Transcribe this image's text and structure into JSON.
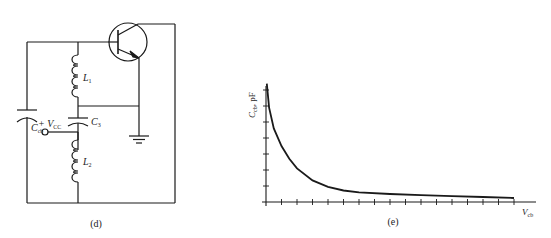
{
  "figure": {
    "panel_d": {
      "caption": "(d)",
      "components": {
        "transistor": "bjt-npn",
        "capacitor_cb": {
          "symbol": "C",
          "subscript": "cb"
        },
        "inductor_1": {
          "symbol": "L",
          "subscript": "1"
        },
        "capacitor_3": {
          "symbol": "C",
          "subscript": "3"
        },
        "inductor_2": {
          "symbol": "L",
          "subscript": "2"
        },
        "supply": {
          "prefix": "+ V",
          "subscript": "CC"
        },
        "ground": "ground-symbol"
      }
    },
    "panel_e": {
      "caption": "(e)",
      "y_label": {
        "symbol": "C",
        "subscript": "cb",
        "unit": ", pF"
      },
      "x_label": {
        "symbol": "V",
        "subscript": "cb"
      }
    }
  },
  "colors": {
    "line": "#1a1a1a",
    "background": "#ffffff"
  },
  "chart_data": {
    "type": "line",
    "title": "",
    "xlabel": "V_cb",
    "ylabel": "C_cb, pF",
    "grid": false,
    "x_ticks": 16,
    "y_ticks": 7,
    "x_tick_labels": [],
    "y_tick_labels": [],
    "xlim": [
      0,
      16
    ],
    "ylim": [
      0,
      7.5
    ],
    "series": [
      {
        "name": "C_cb vs V_cb",
        "x": [
          0.05,
          0.2,
          0.5,
          1,
          1.5,
          2,
          3,
          4,
          5,
          6,
          8,
          10,
          12,
          14,
          16
        ],
        "y": [
          7.4,
          5.9,
          4.6,
          3.5,
          2.7,
          2.1,
          1.35,
          0.95,
          0.72,
          0.6,
          0.5,
          0.43,
          0.37,
          0.31,
          0.25
        ]
      }
    ]
  }
}
